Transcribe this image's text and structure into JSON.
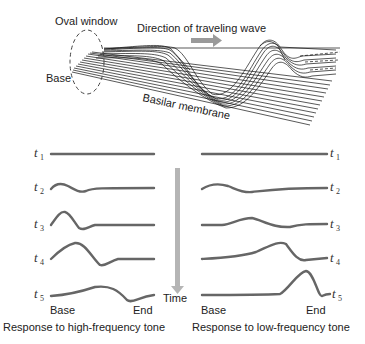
{
  "top_diagram": {
    "oval_window_label": "Oval window",
    "direction_label": "Direction of traveling wave",
    "base_label": "Base",
    "membrane_label": "Basilar membrane",
    "arrow_color": "#9a9a9a"
  },
  "time_axis": {
    "label": "Time",
    "arrow_color": "#b5b5b5"
  },
  "high_frequency_panel": {
    "caption": "Response to high-frequency tone",
    "base_label": "Base",
    "end_label": "End",
    "rows": [
      {
        "t": "t",
        "sub": "1"
      },
      {
        "t": "t",
        "sub": "2"
      },
      {
        "t": "t",
        "sub": "3"
      },
      {
        "t": "t",
        "sub": "4"
      },
      {
        "t": "t",
        "sub": "5"
      }
    ]
  },
  "low_frequency_panel": {
    "caption": "Response to low-frequency tone",
    "base_label": "Base",
    "end_label": "End",
    "rows": [
      {
        "t": "t",
        "sub": "1"
      },
      {
        "t": "t",
        "sub": "2"
      },
      {
        "t": "t",
        "sub": "3"
      },
      {
        "t": "t",
        "sub": "4"
      },
      {
        "t": "t",
        "sub": "5"
      }
    ]
  },
  "wave_color": "#666666"
}
